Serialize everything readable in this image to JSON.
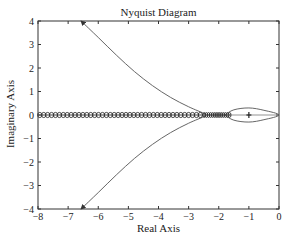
{
  "chart_data": {
    "type": "line",
    "title": "Nyquist Diagram",
    "xlabel": "Real Axis",
    "ylabel": "Imaginary Axis",
    "xlim": [
      -8,
      0
    ],
    "ylim": [
      -4,
      4
    ],
    "xticks": [
      -8,
      -7,
      -6,
      -5,
      -4,
      -3,
      -2,
      -1,
      0
    ],
    "yticks": [
      -4,
      -3,
      -2,
      -1,
      0,
      1,
      2,
      3,
      4
    ],
    "xtick_labels": [
      "-8",
      "-7",
      "-6",
      "-5",
      "-4",
      "-3",
      "-2",
      "-1",
      "0"
    ],
    "ytick_labels": [
      "-4",
      "-3",
      "-2",
      "-1",
      "0",
      "1",
      "2",
      "3",
      "4"
    ],
    "grid": false,
    "series": [
      {
        "name": "upper branch",
        "style": "line",
        "arrow": "toward upper-left at (-6.6, 4)",
        "x": [
          -2.45,
          -3.0,
          -3.6,
          -4.2,
          -4.8,
          -5.4,
          -6.0,
          -6.57
        ],
        "y": [
          0.05,
          0.35,
          0.75,
          1.25,
          1.85,
          2.55,
          3.3,
          4.0
        ]
      },
      {
        "name": "lower branch",
        "style": "line",
        "arrow": "toward lower-left at (-6.6, -4)",
        "x": [
          -2.45,
          -3.0,
          -3.6,
          -4.2,
          -4.8,
          -5.4,
          -6.0,
          -6.57
        ],
        "y": [
          -0.05,
          -0.35,
          -0.75,
          -1.25,
          -1.85,
          -2.55,
          -3.3,
          -4.0
        ]
      },
      {
        "name": "closed loop near origin",
        "style": "line",
        "x": [
          -1.8,
          -1.5,
          -1.0,
          -0.5,
          0.0,
          -0.5,
          -1.0,
          -1.5,
          -1.8
        ],
        "y": [
          0.0,
          0.22,
          0.3,
          0.2,
          0.0,
          -0.2,
          -0.3,
          -0.22,
          0.0
        ]
      },
      {
        "name": "real-axis circle markers",
        "style": "markers-o",
        "x_range": [
          -8,
          -1.6
        ],
        "y": 0
      },
      {
        "name": "critical point",
        "style": "marker-plus",
        "x": [
          -1
        ],
        "y": [
          0
        ]
      }
    ],
    "annotations": [
      "+ marker at (-1, 0)"
    ]
  },
  "header": {
    "clipped_text": "Nyquist Diagram of ... (partially cut off)"
  }
}
